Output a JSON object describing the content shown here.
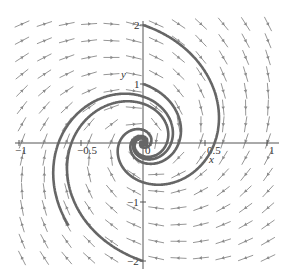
{
  "chart_data": {
    "type": "direction-field",
    "title": "",
    "xlabel": "x",
    "ylabel": "y",
    "xlim": [
      -1,
      1
    ],
    "ylim": [
      -2,
      2
    ],
    "x_ticks": [
      {
        "value": -1,
        "label": "−1"
      },
      {
        "value": -0.5,
        "label": "−0.5"
      },
      {
        "value": 0,
        "label": "0"
      },
      {
        "value": 0.5,
        "label": "0.5"
      },
      {
        "value": 1,
        "label": "1"
      }
    ],
    "y_ticks": [
      {
        "value": 2,
        "label": "2"
      },
      {
        "value": 1,
        "label": "1"
      },
      {
        "value": -1,
        "label": "−1"
      },
      {
        "value": -2,
        "label": "−2"
      }
    ],
    "grid": false,
    "system": {
      "description": "linear spiral sink, clockwise rotation toward origin",
      "dx": {
        "a": -0.35,
        "b": 0.5
      },
      "dy": {
        "c": -2.0,
        "d": -0.35
      }
    },
    "field_grid": {
      "cols": 12,
      "rows": 15
    },
    "trajectories": [
      {
        "start": [
          0,
          2
        ]
      },
      {
        "start": [
          0,
          1
        ]
      },
      {
        "start": [
          -0.6,
          -1.4
        ]
      },
      {
        "start": [
          0,
          -2
        ]
      }
    ],
    "equilibrium": [
      0,
      0
    ],
    "colors": {
      "arrow": "#8a8a8a",
      "trajectory": "#666666",
      "axis": "#555555"
    }
  }
}
